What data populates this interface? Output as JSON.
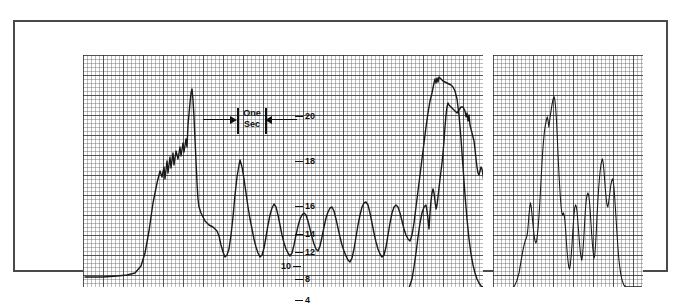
{
  "figure": {
    "background_color": "#ffffff",
    "frame_color": "#4a4a4a",
    "trace_color": "#1a1a1a",
    "grid_color": "#282828"
  },
  "time_marker": {
    "line1": "One",
    "line2": "Sec",
    "left_arrow": "arrow-right-icon",
    "right_arrow": "arrow-left-icon",
    "left_bar": "tick-bar",
    "right_bar": "tick-bar"
  },
  "axis": {
    "ticks": [
      {
        "label": "20",
        "y": 61,
        "side": "right"
      },
      {
        "label": "18",
        "y": 106,
        "side": "right"
      },
      {
        "label": "16",
        "y": 151,
        "side": "right"
      },
      {
        "label": "14",
        "y": 179,
        "side": "right"
      },
      {
        "label": "12",
        "y": 197,
        "side": "right"
      },
      {
        "label": "10",
        "y": 211,
        "side": "left"
      },
      {
        "label": "8",
        "y": 224,
        "side": "right"
      },
      {
        "label": "4",
        "y": 245,
        "side": "right"
      }
    ]
  },
  "panels": [
    {
      "name": "left-panel",
      "x": 68,
      "width": 400
    },
    {
      "name": "right-panel",
      "x": 478,
      "width": 150
    }
  ],
  "chart_data": {
    "type": "line",
    "xlabel": "Time",
    "ylabel": "",
    "grid": true,
    "legend": null,
    "annotations": [
      {
        "text": "One Sec",
        "kind": "interval-marker",
        "x": 188,
        "y": 86,
        "width": 78
      }
    ],
    "ylim": [
      0,
      22
    ],
    "yticks": [
      4,
      8,
      10,
      12,
      14,
      16,
      18,
      20
    ],
    "series": [
      {
        "name": "burst-1",
        "panel": "left-panel",
        "points": "2,222 20,222 34,221 44,220 52,218 58,211 62,198 66,176 70,148 74,128 77,116 79,122 81,112 82,124 84,106 85,118 87,102 88,113 90,98 91,110 93,96 95,104 97,92 98,101 100,88 101,97 103,84 104,92 105,70 107,48 108,38 109,34 110,45 111,62 112,84 113,106 114,128 115,144 116,152 118,158 120,162 122,166 124,168 126,170 128,171 130,172 132,174 134,176 136,181 138,190 140,197 142,202 144,200 146,194 148,180 150,162 152,140 154,122 156,110 157,105 159,112 161,124 163,138 165,152 167,164 169,174 171,184 173,192 175,198 177,202 179,200 181,193 183,182 185,170 187,160 189,153 191,149 193,152 195,160 197,170 199,180 201,188 203,194 205,198 207,201 209,198 211,190 213,180 215,171 217,164 219,160 221,158 223,160 225,166 227,174 229,182 231,189 233,194 235,196 237,191 239,182 241,172 243,163 245,157 247,153 249,152 251,156 253,164 255,173 257,182 259,190 261,196 263,201 265,205 267,207 269,203 271,194 273,182 275,170 277,160 279,152 281,148 283,147 285,150 287,158 289,168 291,178 293,187 295,194 297,199 299,202 301,200 303,192 305,180 307,168 309,158 311,152 313,150 315,152 317,158 319,166 321,174 323,180 325,184 327,186 329,180 331,168 333,152 335,136 337,120 339,104 341,88 343,72 345,58 347,46 349,38 350,33 351,28 352,24 353,28 354,23 355,27 356,22 358,24 360,26 362,27 364,28 366,29 368,30 370,32 372,36 374,44 376,60 378,84 380,112 382,140 384,164 386,184 388,199 390,210 392,218 394,224 396,228 398,231 400,232 402,233 404,234 406,234 408,234 410,235 414,235 418,235"
      },
      {
        "name": "burst-2",
        "panel": "left-panel",
        "points": "300,242 306,242 312,241 318,240 322,238 326,233 329,224 331,212 333,198 335,182 337,168 339,158 341,152 343,150 344,156 345,164 346,174 347,158 348,146 349,138 350,134 351,138 352,146 353,154 354,150 355,142 356,133 357,124 358,116 359,108 360,98 361,86 362,72 363,60 364,52 365,48 366,50 368,52 370,54 372,56 374,58 376,55 378,52 380,52 382,56 383,62 384,58 385,66 386,60 387,70 388,74 389,78 390,82 391,86 392,94 393,104 394,112 395,118 396,120 397,116 398,112 399,114 400,120 401,128 402,138 403,148 404,158 405,168 406,178 407,186 408,192 409,196 410,198 411,196 412,188 413,176 414,162 415,150 416,142 417,138 418,140 419,146 420,156 421,168 422,180 423,192 424,202 425,210 426,216 427,220 428,222 429,218 430,206 431,190 432,174 433,158 434,146 435,138 436,134 437,132 438,134 439,140 440,148 441,158 442,168 443,176 444,180 445,178 446,170 447,158 448,146 449,136 450,130 451,126 452,124 453,120 454,112 455,102 456,94 457,88 458,84 459,82 460,86 461,94 462,104 463,118 464,132 465,148 466,163 467,176 468,188 469,198 470,206 471,213 472,218 473,222 474,225 475,228 476,230 478,231 482,231 486,231 490,230 494,230 498,230"
      },
      {
        "name": "burst-3",
        "panel": "right-panel",
        "points": "2,236 8,236 14,236 20,235 24,234 28,231 31,226 34,218 36,209 38,200 40,192 42,186 44,182 45,178 46,170 47,160 48,152 49,148 50,152 51,160 52,168 53,176 54,182 55,186 56,188 57,186 58,180 59,172 60,162 61,150 62,136 63,122 64,108 65,96 66,86 67,78 68,72 69,68 70,64 71,62 72,66 73,72 74,66 75,60 76,55 77,50 78,46 79,43 80,42 81,46 82,54 83,66 84,82 85,100 86,116 87,130 88,142 89,152 90,158 91,160 92,158 93,160 94,166 95,176 96,188 97,198 98,206 99,212 100,214 101,210 102,202 103,192 104,180 105,168 106,158 107,152 108,150 109,152 110,158 111,168 112,178 113,188 114,196 115,202 116,205 117,200 118,190 119,178 120,164 121,152 122,144 123,140 124,138 125,140 126,146 127,156 128,168 129,180 130,190 131,198 132,203 133,200 134,190 135,176 136,160 137,146 138,134 139,124 140,116 141,110 142,106 143,104 144,108 145,116 146,126 147,136 148,144 149,150 150,152 151,148 152,142 153,136 154,130 155,126 156,124 157,126 158,132 159,142 160,154 161,166 162,178 163,190 164,200 165,208 166,214 167,219 168,223 169,226 170,228 171,230 172,231 174,232 178,232 182,232 186,232 190,232 194,232"
      }
    ]
  }
}
